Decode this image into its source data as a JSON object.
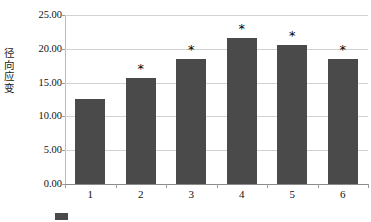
{
  "chart_data": {
    "type": "bar",
    "title": "",
    "xlabel": "",
    "ylabel": "径向应变",
    "categories": [
      "1",
      "2",
      "3",
      "4",
      "5",
      "6"
    ],
    "values": [
      12.6,
      15.7,
      18.5,
      21.6,
      20.6,
      18.5
    ],
    "annotations": [
      "",
      "*",
      "*",
      "*",
      "*",
      "*"
    ],
    "ylim": [
      0,
      25
    ],
    "yticks": [
      "25.00",
      "20.00",
      "15.00",
      "10.00",
      "5.00",
      "0.00"
    ],
    "ytick_values": [
      25,
      20,
      15,
      10,
      5,
      0
    ],
    "grid": true,
    "legend": "none",
    "bar_color": "#4a4a4a",
    "grid_color": "#d2d2d2",
    "axis_color": "#8a8a8a"
  },
  "caption": {
    "text": "",
    "marker_visible": true
  }
}
